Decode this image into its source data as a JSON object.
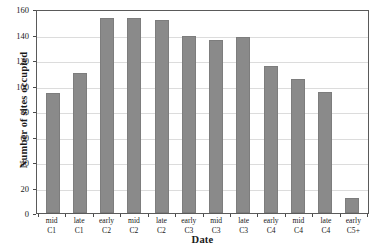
{
  "chart_data": {
    "type": "bar",
    "title": "",
    "xlabel": "Date",
    "ylabel": "Number of sites occupied",
    "categories": [
      "mid C1",
      "late C1",
      "early C2",
      "mid C2",
      "late C2",
      "early C3",
      "mid C3",
      "late C3",
      "early C4",
      "mid C4",
      "late C4",
      "early C5+"
    ],
    "category_lines": [
      {
        "line1": "mid",
        "line2": "C1"
      },
      {
        "line1": "late",
        "line2": "C1"
      },
      {
        "line1": "early",
        "line2": "C2"
      },
      {
        "line1": "mid",
        "line2": "C2"
      },
      {
        "line1": "late",
        "line2": "C2"
      },
      {
        "line1": "early",
        "line2": "C3"
      },
      {
        "line1": "mid",
        "line2": "C3"
      },
      {
        "line1": "late",
        "line2": "C3"
      },
      {
        "line1": "early",
        "line2": "C4"
      },
      {
        "line1": "mid",
        "line2": "C4"
      },
      {
        "line1": "late",
        "line2": "C4"
      },
      {
        "line1": "early",
        "line2": "C5+"
      }
    ],
    "values": [
      94,
      110,
      153,
      153,
      151,
      139,
      136,
      138,
      115,
      105,
      95,
      12
    ],
    "ylim": [
      0,
      160
    ],
    "ytick_values": [
      0,
      20,
      40,
      60,
      80,
      100,
      120,
      140,
      160
    ],
    "ytick_labels": [
      "0",
      "20",
      "40",
      "60",
      "80",
      "100",
      "120",
      "140",
      "160"
    ],
    "grid": true,
    "legend": false,
    "bar_color": "#8a8a8a",
    "axis_color": "#5a5a5a",
    "grid_color": "#dcdcdc"
  }
}
